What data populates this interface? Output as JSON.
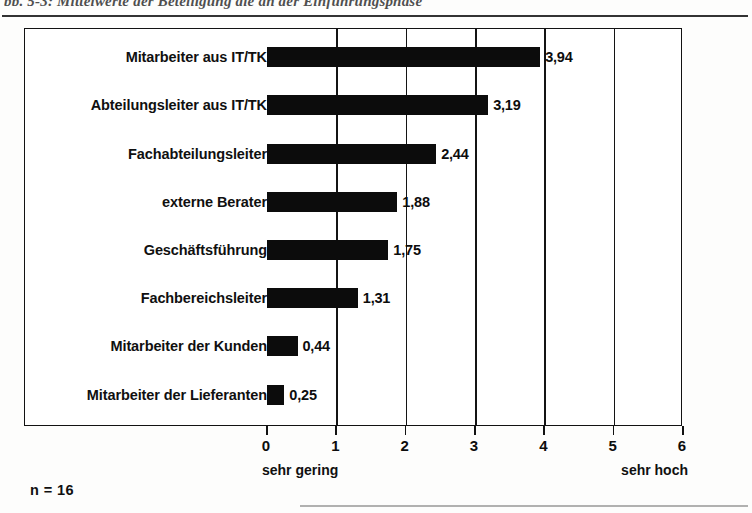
{
  "page": {
    "caption_partial": "bb. 5-3: Mittelwerte der Beteiligung die an der Einführungsphase",
    "sample_note": "n = 16"
  },
  "chart_data": {
    "type": "bar",
    "orientation": "horizontal",
    "title": "",
    "xlabel": "",
    "ylabel": "",
    "categories": [
      "Mitarbeiter aus IT/TK",
      "Abteilungsleiter aus IT/TK",
      "Fachabteilungsleiter",
      "externe Berater",
      "Geschäftsführung",
      "Fachbereichsleiter",
      "Mitarbeiter der Kunden",
      "Mitarbeiter der Lieferanten"
    ],
    "values": [
      3.94,
      3.19,
      2.44,
      1.88,
      1.75,
      1.31,
      0.44,
      0.25
    ],
    "value_labels": [
      "3,94",
      "3,19",
      "2,44",
      "1,88",
      "1,75",
      "1,31",
      "0,44",
      "0,25"
    ],
    "xlim": [
      0,
      6
    ],
    "xticks": [
      0,
      1,
      2,
      3,
      4,
      5,
      6
    ],
    "xticklabels": [
      "0",
      "1",
      "2",
      "3",
      "4",
      "5",
      "6"
    ],
    "gridlines": [
      1,
      2,
      3,
      4,
      5
    ],
    "grid": true,
    "legend": "none",
    "scale_low_label": "sehr gering",
    "scale_high_label": "sehr hoch",
    "bar_color": "#0c0c0c",
    "n": 16
  }
}
